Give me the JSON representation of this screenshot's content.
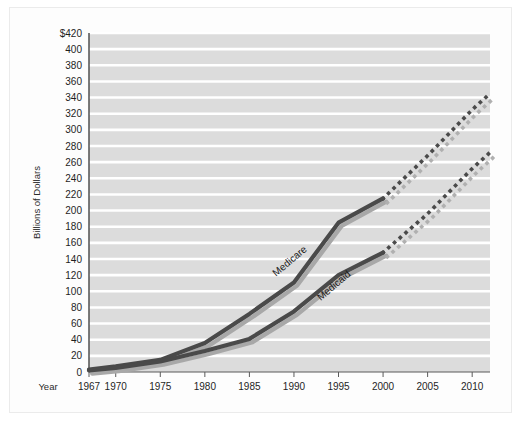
{
  "figure": {
    "background_color": "#ffffff",
    "frame_color": "#ebebeb",
    "plot_background_color": "#dcdcdc",
    "gridline_color": "#ffffff",
    "axis_color": "#5a5a5a"
  },
  "axes": {
    "y_axis_title": "Billions of Dollars",
    "x_axis_title": "Year",
    "y_ticks": [
      "$420",
      "400",
      "380",
      "360",
      "340",
      "320",
      "300",
      "280",
      "260",
      "240",
      "220",
      "200",
      "180",
      "160",
      "140",
      "120",
      "100",
      "80",
      "60",
      "40",
      "20",
      "0"
    ],
    "x_ticks": [
      "1967",
      "1970",
      "1975",
      "1980",
      "1985",
      "1990",
      "1995",
      "2000",
      "2005",
      "2010"
    ]
  },
  "series_labels": {
    "medicare": "Medicare",
    "medicaid": "Medicaid"
  },
  "colors": {
    "line_primary": "#4a4a4a",
    "line_shadow": "#a8a8a8",
    "dot_primary": "#4a4a4a",
    "dot_shadow": "#b0b0b0"
  },
  "chart_data": {
    "type": "line",
    "title": "",
    "subtitle": "",
    "xlabel": "Year",
    "ylabel": "Billions of Dollars",
    "xlim": [
      1967,
      2012
    ],
    "ylim": [
      0,
      420
    ],
    "y_tick_step": 20,
    "grid": true,
    "grid_axis": "y",
    "legend_position": "inline-annotations",
    "annotations": [
      {
        "text": "Medicare",
        "x": 1988,
        "y": 118,
        "rotation": -40
      },
      {
        "text": "Medicaid",
        "x": 1993,
        "y": 88,
        "rotation": -40
      }
    ],
    "x": [
      1967,
      1970,
      1975,
      1980,
      1985,
      1990,
      1995,
      2000,
      2005,
      2010,
      2012
    ],
    "series": [
      {
        "name": "Medicare",
        "values": [
          3,
          7,
          15,
          36,
          72,
          111,
          185,
          215,
          268,
          325,
          345
        ],
        "style": "solid-then-dotted",
        "projection_starts": 2000,
        "color": "#4a4a4a"
      },
      {
        "name": "Medicaid",
        "values": [
          2,
          5,
          13,
          26,
          41,
          75,
          120,
          148,
          196,
          252,
          272
        ],
        "style": "solid-then-dotted",
        "projection_starts": 2000,
        "color": "#4a4a4a"
      }
    ]
  }
}
